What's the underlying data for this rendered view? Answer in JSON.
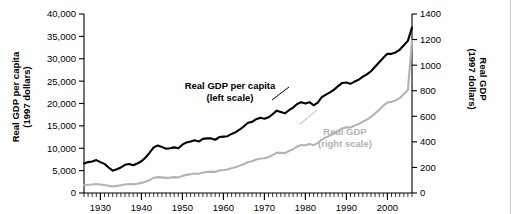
{
  "chart_data": {
    "type": "line",
    "title": "",
    "xlabel": "",
    "xlim": [
      1926,
      2006
    ],
    "grid": false,
    "legend_position": "inline-annotations",
    "x_ticks": [
      "1930",
      "1940",
      "1950",
      "1960",
      "1970",
      "1980",
      "1990",
      "2000"
    ],
    "x_tick_values": [
      1930,
      1940,
      1950,
      1960,
      1970,
      1980,
      1990,
      2000
    ],
    "x_minor_tick_interval": 1,
    "axes": [
      {
        "id": "left",
        "label_line1": "Real GDP per capita",
        "label_line2": "(1997 dollars)",
        "ylim": [
          0,
          40000
        ],
        "tick_values": [
          0,
          5000,
          10000,
          15000,
          20000,
          25000,
          30000,
          35000,
          40000
        ],
        "tick_labels": [
          "0",
          "5,000",
          "10,000",
          "15,000",
          "20,000",
          "25,000",
          "30,000",
          "35,000",
          "40,000"
        ]
      },
      {
        "id": "right",
        "label_line1": "Real GDP",
        "label_line2": "(1997 dollars)",
        "ylim": [
          0,
          1400
        ],
        "tick_values": [
          0,
          200,
          400,
          600,
          800,
          1000,
          1200,
          1400
        ],
        "tick_labels": [
          "0",
          "200",
          "400",
          "600",
          "800",
          "1000",
          "1200",
          "1400"
        ]
      }
    ],
    "annotations": [
      {
        "id": "capita",
        "line1": "Real GDP per capita",
        "line2": "(left scale)",
        "color": "#000000"
      },
      {
        "id": "gdp",
        "line1": "Real GDP",
        "line2": "(right scale)",
        "color": "#b3b3b3"
      }
    ],
    "series": [
      {
        "name": "Real GDP per capita",
        "axis": "left",
        "color": "#000000",
        "scale_note": "left scale, 1997 dollars",
        "x": [
          1926,
          1927,
          1928,
          1929,
          1930,
          1931,
          1932,
          1933,
          1934,
          1935,
          1936,
          1937,
          1938,
          1939,
          1940,
          1941,
          1942,
          1943,
          1944,
          1945,
          1946,
          1947,
          1948,
          1949,
          1950,
          1951,
          1952,
          1953,
          1954,
          1955,
          1956,
          1957,
          1958,
          1959,
          1960,
          1961,
          1962,
          1963,
          1964,
          1965,
          1966,
          1967,
          1968,
          1969,
          1970,
          1971,
          1972,
          1973,
          1974,
          1975,
          1976,
          1977,
          1978,
          1979,
          1980,
          1981,
          1982,
          1983,
          1984,
          1985,
          1986,
          1987,
          1988,
          1989,
          1990,
          1991,
          1992,
          1993,
          1994,
          1995,
          1996,
          1997,
          1998,
          1999,
          2000,
          2001,
          2002,
          2003,
          2004,
          2005,
          2006
        ],
        "values": [
          6600,
          6900,
          7050,
          7350,
          6900,
          6500,
          5700,
          5000,
          5300,
          5700,
          6300,
          6500,
          6200,
          6600,
          7100,
          7900,
          9000,
          10200,
          10600,
          10300,
          9900,
          10000,
          10200,
          10000,
          10800,
          11300,
          11500,
          11800,
          11500,
          12100,
          12200,
          12200,
          11900,
          12500,
          12600,
          12700,
          13200,
          13600,
          14200,
          14900,
          15700,
          15900,
          16500,
          16800,
          16600,
          16900,
          17600,
          18400,
          18100,
          17800,
          18500,
          19100,
          19900,
          20300,
          20000,
          20300,
          19600,
          20200,
          21400,
          22000,
          22500,
          23100,
          23900,
          24600,
          24700,
          24400,
          24900,
          25300,
          26000,
          26500,
          27200,
          28200,
          29200,
          30200,
          31100,
          31100,
          31400,
          32000,
          33000,
          34000,
          37000
        ],
        "endpoints": {
          "start_year": 1926,
          "start_value": 6600,
          "end_year": 2006,
          "end_value": 37000
        },
        "features": [
          "Great Depression trough near 1933 at about 5,000",
          "World War II peak about 1944",
          "steady postwar growth",
          "plateaus near 1980-1982 and 1990-1991"
        ]
      },
      {
        "name": "Real GDP",
        "axis": "right",
        "color": "#b3b3b3",
        "scale_note": "right scale, 1997 dollars",
        "x": [
          1926,
          1927,
          1928,
          1929,
          1930,
          1931,
          1932,
          1933,
          1934,
          1935,
          1936,
          1937,
          1938,
          1939,
          1940,
          1941,
          1942,
          1943,
          1944,
          1945,
          1946,
          1947,
          1948,
          1949,
          1950,
          1951,
          1952,
          1953,
          1954,
          1955,
          1956,
          1957,
          1958,
          1959,
          1960,
          1961,
          1962,
          1963,
          1964,
          1965,
          1966,
          1967,
          1968,
          1969,
          1970,
          1971,
          1972,
          1973,
          1974,
          1975,
          1976,
          1977,
          1978,
          1979,
          1980,
          1981,
          1982,
          1983,
          1984,
          1985,
          1986,
          1987,
          1988,
          1989,
          1990,
          1991,
          1992,
          1993,
          1994,
          1995,
          1996,
          1997,
          1998,
          1999,
          2000,
          2001,
          2002,
          2003,
          2004,
          2005,
          2006
        ],
        "values": [
          62,
          65,
          67,
          70,
          67,
          62,
          56,
          52,
          56,
          61,
          67,
          70,
          68,
          72,
          79,
          88,
          102,
          118,
          124,
          122,
          118,
          120,
          124,
          122,
          134,
          142,
          147,
          152,
          150,
          160,
          164,
          167,
          165,
          176,
          180,
          184,
          193,
          202,
          214,
          226,
          242,
          248,
          262,
          270,
          272,
          281,
          297,
          316,
          314,
          312,
          328,
          343,
          363,
          375,
          374,
          383,
          374,
          390,
          418,
          435,
          449,
          466,
          487,
          506,
          514,
          512,
          527,
          539,
          558,
          574,
          595,
          623,
          651,
          682,
          708,
          713,
          724,
          742,
          774,
          806,
          1190
        ],
        "endpoints": {
          "start_year": 1926,
          "start_value": 62,
          "end_year": 2006,
          "end_value": 1190
        },
        "features": [
          "flat and slightly declining through the early 1930s",
          "sustained rise after 1940",
          "parallel plateaus in the early 1980s and early 1990s"
        ]
      }
    ]
  }
}
